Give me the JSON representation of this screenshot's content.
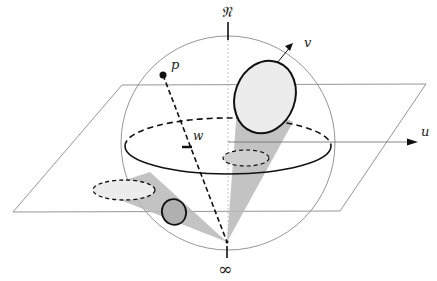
{
  "figure": {
    "labels": {
      "north": "𝔑",
      "infinity": "∞",
      "p": "p",
      "v": "v",
      "u": "u",
      "w": "w"
    },
    "colors": {
      "stroke": "#111111",
      "thin_stroke": "#888888",
      "cone_fill": "#b9b9b9",
      "disk_fill": "#ececec"
    }
  }
}
